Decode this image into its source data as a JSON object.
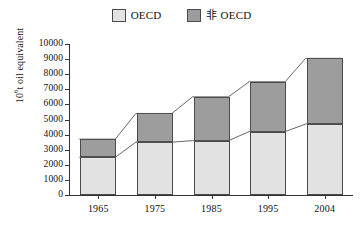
{
  "chart_data": {
    "type": "bar",
    "stacked": true,
    "title": "",
    "subtitle": "",
    "xlabel": "",
    "ylabel": "10⁶t oil equivalent",
    "ylabel_base": "10",
    "ylabel_exp": "6",
    "ylabel_rest": "t oil equivalent",
    "categories": [
      "1965",
      "1975",
      "1985",
      "1995",
      "2004"
    ],
    "series": [
      {
        "name": "OECD",
        "color": "#e2e2e2",
        "values": [
          2500,
          3500,
          3600,
          4200,
          4700
        ]
      },
      {
        "name": "非 OECD",
        "color": "#9d9d9d",
        "values": [
          1200,
          1900,
          2900,
          3300,
          4350
        ]
      }
    ],
    "totals": [
      3700,
      5400,
      6500,
      7500,
      9050
    ],
    "ylim": [
      0,
      10000
    ],
    "ytick_step": 1000,
    "yticks": [
      "10000",
      "9000",
      "8000",
      "7000",
      "6000",
      "5000",
      "4000",
      "3000",
      "2000",
      "1000",
      "0"
    ],
    "ytick_values": [
      10000,
      9000,
      8000,
      7000,
      6000,
      5000,
      4000,
      3000,
      2000,
      1000,
      0
    ],
    "grid": false,
    "legend_position": "top-center",
    "connector_lines": true,
    "axis_color": "#333333",
    "bar_border_color": "#4a4a4a"
  },
  "legend": {
    "entries": [
      {
        "label": "OECD",
        "swatch": "oecd-swatch"
      },
      {
        "label": "非 OECD",
        "swatch": "non-oecd-swatch"
      }
    ]
  }
}
